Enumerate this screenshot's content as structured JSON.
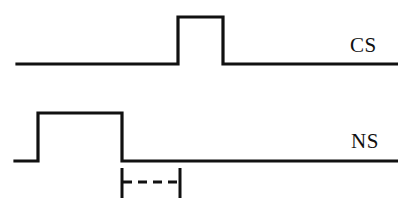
{
  "figure": {
    "type": "stimulus-timing-diagram",
    "background_color": "#ffffff",
    "stroke_color": "#111111",
    "width": 398,
    "height": 205
  },
  "traces": [
    {
      "id": "cs",
      "label": "CS",
      "label_x": 350,
      "label_y": 35,
      "baseline_y": 64,
      "pulse_top_y": 17,
      "line_start_x": 17,
      "line_end_x": 397,
      "pulse_start_x": 178,
      "pulse_end_x": 223,
      "line_width": 3.2
    },
    {
      "id": "ns",
      "label": "NS",
      "label_x": 351,
      "label_y": 131,
      "baseline_y": 161,
      "pulse_top_y": 113,
      "line_start_x": 15,
      "line_end_x": 397,
      "pulse_start_x": 38,
      "pulse_end_x": 122,
      "line_width": 3.2
    }
  ],
  "interval_marker": {
    "id": "isi-bracket",
    "left_tick_x": 122,
    "right_tick_x": 180,
    "tick_top_y": 168,
    "tick_bottom_y": 198,
    "dashed_line_y": 182,
    "dash_pattern": "9 6",
    "line_width": 3.0,
    "caption": ""
  }
}
